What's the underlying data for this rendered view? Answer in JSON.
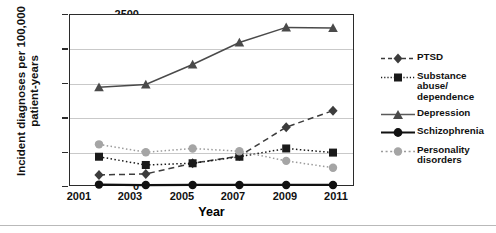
{
  "chart_data": {
    "type": "line",
    "title": "",
    "xlabel": "Year",
    "ylabel": "Incident diagnoses per 100,000 patient-years",
    "categories": [
      "2001",
      "2003",
      "2005",
      "2007",
      "2009",
      "2011"
    ],
    "x": [
      2001,
      2003,
      2005,
      2007,
      2009,
      2011
    ],
    "ylim": [
      0,
      2500
    ],
    "yticks": [
      0,
      500,
      1000,
      1500,
      2000,
      2500
    ],
    "grid": true,
    "legend_position": "right",
    "series": [
      {
        "name": "PTSD",
        "values": [
          175,
          190,
          345,
          450,
          870,
          1110
        ],
        "marker": "diamond",
        "line_style": "dashed",
        "color": "#3c3c3c"
      },
      {
        "name": "Substance abuse/ dependence",
        "values": [
          440,
          320,
          345,
          440,
          560,
          500
        ],
        "marker": "square",
        "line_style": "dotted",
        "color": "#1a1a1a"
      },
      {
        "name": "Depression",
        "values": [
          1450,
          1490,
          1780,
          2100,
          2320,
          2310
        ],
        "marker": "triangle",
        "line_style": "solid",
        "color": "#4a4a4a"
      },
      {
        "name": "Schizophrenia",
        "values": [
          35,
          28,
          30,
          30,
          30,
          30
        ],
        "marker": "circle",
        "line_style": "solid",
        "color": "#111111"
      },
      {
        "name": "Personality disorders",
        "values": [
          620,
          505,
          560,
          520,
          380,
          280
        ],
        "marker": "circle",
        "line_style": "dotted",
        "color": "#9b9b9b"
      }
    ]
  },
  "legend": {
    "entries": [
      {
        "label": "PTSD"
      },
      {
        "label": "Substance abuse/",
        "label2": "dependence"
      },
      {
        "label": "Depression"
      },
      {
        "label": "Schizophrenia"
      },
      {
        "label": "Personality disorders"
      }
    ]
  }
}
